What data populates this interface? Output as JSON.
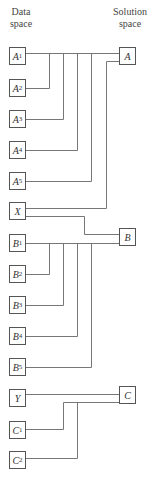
{
  "headers": {
    "data_space": [
      "Data",
      "space"
    ],
    "solution_space": [
      "Solution",
      "space"
    ]
  },
  "data_items": [
    {
      "id": "A1",
      "letter": "A",
      "sub": "1",
      "y": 47
    },
    {
      "id": "A2",
      "letter": "A",
      "sub": "2",
      "y": 79
    },
    {
      "id": "A3",
      "letter": "A",
      "sub": "3",
      "y": 110
    },
    {
      "id": "A4",
      "letter": "A",
      "sub": "4",
      "y": 141
    },
    {
      "id": "A5",
      "letter": "A",
      "sub": "5",
      "y": 172
    },
    {
      "id": "X",
      "letter": "X",
      "sub": "",
      "y": 202
    },
    {
      "id": "B1",
      "letter": "B",
      "sub": "1",
      "y": 234
    },
    {
      "id": "B2",
      "letter": "B",
      "sub": "2",
      "y": 265
    },
    {
      "id": "B3",
      "letter": "B",
      "sub": "3",
      "y": 296
    },
    {
      "id": "B4",
      "letter": "B",
      "sub": "4",
      "y": 327
    },
    {
      "id": "B5",
      "letter": "B",
      "sub": "5",
      "y": 358
    },
    {
      "id": "Y",
      "letter": "Y",
      "sub": "",
      "y": 389
    },
    {
      "id": "C1",
      "letter": "C",
      "sub": "1",
      "y": 421
    },
    {
      "id": "C2",
      "letter": "C",
      "sub": "2",
      "y": 451
    }
  ],
  "solution_items": [
    {
      "id": "A",
      "letter": "A",
      "y": 47
    },
    {
      "id": "B",
      "letter": "B",
      "y": 228
    },
    {
      "id": "C",
      "letter": "C",
      "y": 386
    }
  ],
  "connections": [
    {
      "from": [
        "A1",
        "A2",
        "A3",
        "A4",
        "A5"
      ],
      "to": "A"
    },
    {
      "from": [
        "X"
      ],
      "to": "A"
    },
    {
      "from": [
        "X"
      ],
      "to": "B"
    },
    {
      "from": [
        "B1",
        "B2",
        "B3",
        "B4",
        "B5"
      ],
      "to": "B"
    },
    {
      "from": [
        "Y"
      ],
      "to": "C"
    },
    {
      "from": [
        "C1",
        "C2"
      ],
      "to": "C"
    }
  ],
  "line_color": "#777777"
}
